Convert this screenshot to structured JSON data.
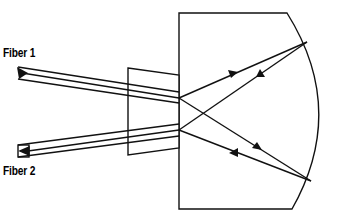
{
  "diagram": {
    "labels": {
      "fiber1": "Fiber 1",
      "fiber2": "Fiber 2"
    },
    "colors": {
      "stroke": "#111111",
      "background": "#ffffff"
    }
  }
}
